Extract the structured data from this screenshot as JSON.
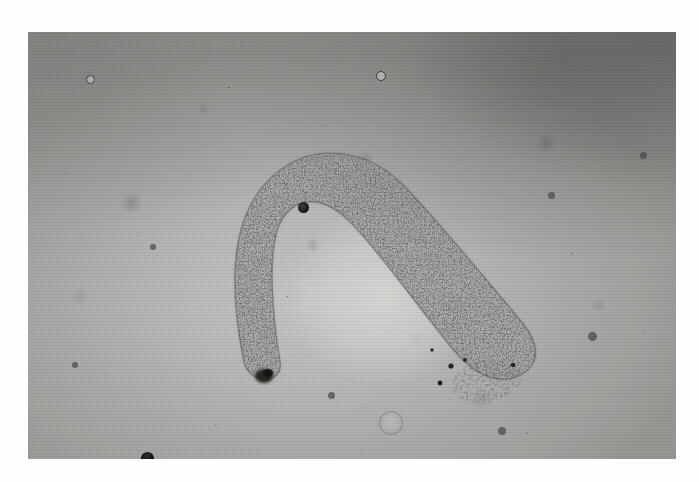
{
  "figure": {
    "kind": "photomicrograph",
    "modality": "brightfield light microscopy",
    "color_mode": "grayscale",
    "caption": "",
    "scale_bar_text": "",
    "magnification_label": ""
  },
  "canvas": {
    "width_px": 699,
    "height_px": 482,
    "paper_color": "#fefefe",
    "margin": {
      "top_px": 32,
      "bottom_px": 23,
      "left_px": 28,
      "right_px": 23
    }
  },
  "plate": {
    "x_px": 28,
    "y_px": 32,
    "width_px": 648,
    "height_px": 427,
    "background_color": "#b5b4b2",
    "highlight_color": "#cac9c7",
    "shadow_color": "#8d8c8a",
    "vignette_corner": "top-right"
  },
  "subject": {
    "name": "curved granular organism",
    "shape": "inverted-J / horseshoe arc",
    "fill_color": "#2e2e2c",
    "matrix_color": "#b9b8b6",
    "description": "elongated body densely packed with dark refractile granules, arching from a blunt lower-left tip up over a rounded apex and down to the right into a rounded terminal bulb",
    "apex_point": {
      "x_px": 300,
      "y_px": 116
    },
    "left_tip": {
      "x_px": 243,
      "y_px": 345
    },
    "right_tip": {
      "x_px": 516,
      "y_px": 331
    },
    "body_width_px": 62
  },
  "features": [
    {
      "name": "detached-granule-cluster",
      "x_px": 487,
      "y_px": 381,
      "width_px": 72,
      "height_px": 42,
      "label": ""
    },
    {
      "name": "bubble-ring-artifact",
      "x_px": 390,
      "y_px": 422,
      "diameter_px": 22,
      "label": ""
    },
    {
      "name": "edge-debris-blob",
      "x_px": 152,
      "y_px": 456,
      "diameter_px": 14,
      "label": ""
    },
    {
      "name": "focused-dark-particle",
      "x_px": 305,
      "y_px": 207,
      "diameter_px": 11,
      "label": ""
    },
    {
      "name": "ringed-particle",
      "x_px": 88,
      "y_px": 76,
      "diameter_px": 9,
      "label": ""
    },
    {
      "name": "ringed-particle",
      "x_px": 379,
      "y_px": 72,
      "diameter_px": 10,
      "label": ""
    }
  ],
  "overlays": {
    "text_annotations": [],
    "arrows": [],
    "scale_bar": null
  }
}
